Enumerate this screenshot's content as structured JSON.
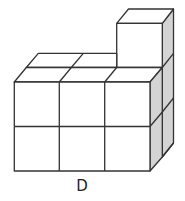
{
  "figure": {
    "label": "D",
    "colors": {
      "line": "#333333",
      "face": "#ffffff",
      "shade": "#d4d4d4"
    },
    "structure": {
      "front_block": {
        "columns": 3,
        "rows": 2
      },
      "top_back_cubes": 2,
      "tall_column_height": 3
    }
  }
}
